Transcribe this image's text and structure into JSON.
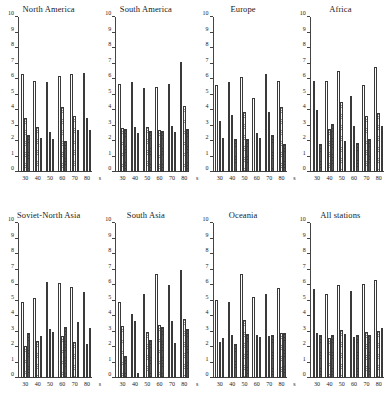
{
  "figure": {
    "axis": {
      "ylim": [
        0,
        10
      ],
      "yticks": [
        0,
        1,
        2,
        3,
        4,
        5,
        6,
        7,
        8,
        9,
        10
      ],
      "ytick_labels": [
        "0",
        "1",
        "2",
        "3",
        "4",
        "5",
        "6",
        "7",
        "8",
        "9",
        "10"
      ],
      "categories": [
        "30",
        "40",
        "50",
        "60",
        "70",
        "80"
      ],
      "xunit": "s",
      "grid": false,
      "legend": "none"
    },
    "series_names": [
      "series-1",
      "series-2",
      "series-3"
    ]
  },
  "chart_data": [
    {
      "type": "bar",
      "title": "North America",
      "xlabel": "s",
      "ylabel": "",
      "ylim": [
        0,
        10
      ],
      "categories": [
        "30",
        "40",
        "50",
        "60",
        "70",
        "80"
      ],
      "series": [
        {
          "name": "series-1",
          "values": [
            6.3,
            5.9,
            5.8,
            6.2,
            6.3,
            6.4
          ]
        },
        {
          "name": "series-2",
          "values": [
            3.5,
            2.9,
            2.6,
            4.2,
            3.6,
            3.5
          ]
        },
        {
          "name": "series-3",
          "values": [
            2.4,
            2.2,
            2.1,
            2.0,
            2.7,
            2.7
          ]
        }
      ]
    },
    {
      "type": "bar",
      "title": "South America",
      "xlabel": "s",
      "ylabel": "",
      "ylim": [
        0,
        10
      ],
      "categories": [
        "30",
        "40",
        "50",
        "60",
        "70",
        "80"
      ],
      "series": [
        {
          "name": "series-1",
          "values": [
            5.7,
            5.8,
            5.4,
            5.5,
            5.65,
            7.1
          ]
        },
        {
          "name": "series-2",
          "values": [
            2.85,
            2.9,
            2.9,
            2.7,
            2.95,
            4.25
          ]
        },
        {
          "name": "series-3",
          "values": [
            2.75,
            2.5,
            2.65,
            2.65,
            2.6,
            2.75
          ]
        }
      ]
    },
    {
      "type": "bar",
      "title": "Europe",
      "xlabel": "s",
      "ylabel": "",
      "ylim": [
        0,
        10
      ],
      "categories": [
        "30",
        "40",
        "50",
        "60",
        "70",
        "80"
      ],
      "series": [
        {
          "name": "series-1",
          "values": [
            5.6,
            5.8,
            6.1,
            4.8,
            6.3,
            5.9
          ]
        },
        {
          "name": "series-2",
          "values": [
            3.3,
            3.7,
            3.9,
            2.5,
            3.9,
            4.2
          ]
        },
        {
          "name": "series-3",
          "values": [
            2.2,
            2.1,
            2.1,
            2.2,
            2.4,
            1.8
          ]
        }
      ]
    },
    {
      "type": "bar",
      "title": "Africa",
      "xlabel": "s",
      "ylabel": "",
      "ylim": [
        0,
        10
      ],
      "categories": [
        "30",
        "40",
        "50",
        "60",
        "70",
        "80"
      ],
      "series": [
        {
          "name": "series-1",
          "values": [
            5.9,
            5.9,
            6.5,
            4.9,
            5.6,
            6.8
          ]
        },
        {
          "name": "series-2",
          "values": [
            4.0,
            2.8,
            4.5,
            3.0,
            3.6,
            3.8
          ]
        },
        {
          "name": "series-3",
          "values": [
            1.8,
            3.1,
            2.0,
            1.9,
            2.1,
            3.0
          ]
        }
      ]
    },
    {
      "type": "bar",
      "title": "Soviet-North Asia",
      "xlabel": "s",
      "ylabel": "",
      "ylim": [
        0,
        10
      ],
      "categories": [
        "30",
        "40",
        "50",
        "60",
        "70",
        "80"
      ],
      "series": [
        {
          "name": "series-1",
          "values": [
            4.9,
            5.15,
            6.2,
            6.1,
            5.85,
            5.55
          ]
        },
        {
          "name": "series-2",
          "values": [
            2.05,
            2.4,
            3.15,
            2.7,
            2.3,
            2.2
          ]
        },
        {
          "name": "series-3",
          "values": [
            2.9,
            2.7,
            2.95,
            3.3,
            3.6,
            3.2
          ]
        }
      ]
    },
    {
      "type": "bar",
      "title": "South Asia",
      "xlabel": "s",
      "ylabel": "",
      "ylim": [
        0,
        10
      ],
      "categories": [
        "30",
        "40",
        "50",
        "60",
        "70",
        "80"
      ],
      "series": [
        {
          "name": "series-1",
          "values": [
            4.9,
            4.1,
            5.45,
            6.7,
            6.0,
            7.0
          ]
        },
        {
          "name": "series-2",
          "values": [
            3.35,
            3.65,
            3.0,
            3.4,
            3.65,
            3.8
          ]
        },
        {
          "name": "series-3",
          "values": [
            1.4,
            0.35,
            2.45,
            3.3,
            2.25,
            3.15
          ]
        }
      ]
    },
    {
      "type": "bar",
      "title": "Oceania",
      "xlabel": "s",
      "ylabel": "",
      "ylim": [
        0,
        10
      ],
      "categories": [
        "30",
        "40",
        "50",
        "60",
        "70",
        "80"
      ],
      "series": [
        {
          "name": "series-1",
          "values": [
            5.05,
            4.9,
            6.7,
            5.2,
            5.4,
            5.8
          ]
        },
        {
          "name": "series-2",
          "values": [
            2.3,
            2.8,
            3.75,
            2.8,
            2.7,
            2.9
          ]
        },
        {
          "name": "series-3",
          "values": [
            2.55,
            2.2,
            2.85,
            2.65,
            2.8,
            2.9
          ]
        }
      ]
    },
    {
      "type": "bar",
      "title": "All stations",
      "xlabel": "s",
      "ylabel": "",
      "ylim": [
        0,
        10
      ],
      "categories": [
        "30",
        "40",
        "50",
        "60",
        "70",
        "80"
      ],
      "series": [
        {
          "name": "series-1",
          "values": [
            5.75,
            5.4,
            6.0,
            5.6,
            6.05,
            6.3
          ]
        },
        {
          "name": "series-2",
          "values": [
            2.9,
            2.6,
            3.1,
            2.65,
            2.95,
            3.05
          ]
        },
        {
          "name": "series-3",
          "values": [
            2.8,
            2.75,
            2.85,
            2.75,
            2.8,
            3.2
          ]
        }
      ]
    }
  ]
}
